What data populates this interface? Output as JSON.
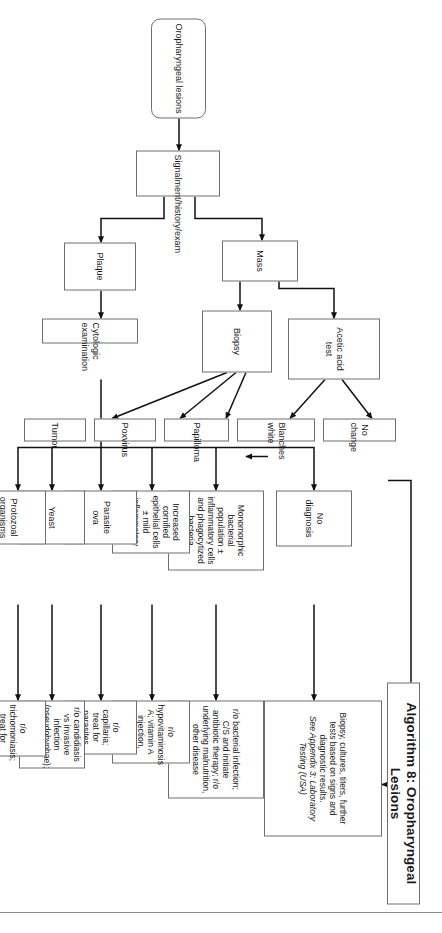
{
  "figure": {
    "title": "Algorithm 8: Oropharyngeal Lesions",
    "orientation": "rotated-90",
    "line_color": "#6e6e6e",
    "text_color": "#1a1a1a",
    "background": "#ffffff"
  },
  "nodes": {
    "start": "Oropharyngeal lesions",
    "signalment": "Signalment/history/exam",
    "mass": "Mass",
    "plaque": "Plaque",
    "acetic_acid_test": "Acetic acid test",
    "biopsy": "Biopsy",
    "no_change": "No change",
    "blanches_white": "Blanches white",
    "papilloma": "Papilloma",
    "poxvirus": "Poxvirus",
    "tumor": "Tumor",
    "cytologic_examination": "Cytologic examination",
    "no_diagnosis": "No diagnosis",
    "monomorphic_bacteria": "Monomorphic bacterial population ± inflammatory cells and phagocytized bacteria",
    "cornified_cells": "Increased cornified epithelial cells ± mild inflammatory cells",
    "parasite_ova": "Parasite ova",
    "yeast": "Yeast",
    "protozoal_organisms": "Protozoal organisms",
    "lab_testing_line1": "Biopsy, cultures, titers, further tests based on signs and diagnostic results.",
    "lab_testing_line2": "See Appendix 3: Laboratory Testing (USA)",
    "rule_out_bacterial": "r/o bacterial infection; C/S and initiate antibiotic therapy; r/o underlying malnutrition, other disease",
    "rule_out_hypovitaminosis": "r/o hypovitaminosis A; vitamin A injection, change diet",
    "rule_out_capillaria": "r/o capillaria; treat for parasites",
    "rule_out_candidiasis": "r/o candidiasis vs invasive infection (pseudohyphae); treat accordingly",
    "rule_out_trichomoniasis": "r/o trichomoniasis; treat for protozoa"
  },
  "flow": {
    "edges": [
      {
        "from": "start",
        "to": "signalment"
      },
      {
        "from": "signalment",
        "to": "mass"
      },
      {
        "from": "signalment",
        "to": "plaque"
      },
      {
        "from": "mass",
        "to": "acetic_acid_test"
      },
      {
        "from": "mass",
        "to": "biopsy"
      },
      {
        "from": "acetic_acid_test",
        "to": "no_change"
      },
      {
        "from": "acetic_acid_test",
        "to": "blanches_white"
      },
      {
        "from": "blanches_white",
        "to": "papilloma"
      },
      {
        "from": "biopsy",
        "to": "papilloma"
      },
      {
        "from": "biopsy",
        "to": "poxvirus"
      },
      {
        "from": "biopsy",
        "to": "tumor"
      },
      {
        "from": "no_change",
        "to": "lab_testing_line1"
      },
      {
        "from": "plaque",
        "to": "cytologic_examination"
      },
      {
        "from": "cytologic_examination",
        "to": "no_diagnosis"
      },
      {
        "from": "cytologic_examination",
        "to": "monomorphic_bacteria"
      },
      {
        "from": "cytologic_examination",
        "to": "cornified_cells"
      },
      {
        "from": "cytologic_examination",
        "to": "parasite_ova"
      },
      {
        "from": "cytologic_examination",
        "to": "yeast"
      },
      {
        "from": "cytologic_examination",
        "to": "protozoal_organisms"
      },
      {
        "from": "no_diagnosis",
        "to": "lab_testing_line1"
      },
      {
        "from": "monomorphic_bacteria",
        "to": "rule_out_bacterial"
      },
      {
        "from": "cornified_cells",
        "to": "rule_out_hypovitaminosis"
      },
      {
        "from": "parasite_ova",
        "to": "rule_out_capillaria"
      },
      {
        "from": "yeast",
        "to": "rule_out_candidiasis"
      },
      {
        "from": "protozoal_organisms",
        "to": "rule_out_trichomoniasis"
      }
    ]
  }
}
